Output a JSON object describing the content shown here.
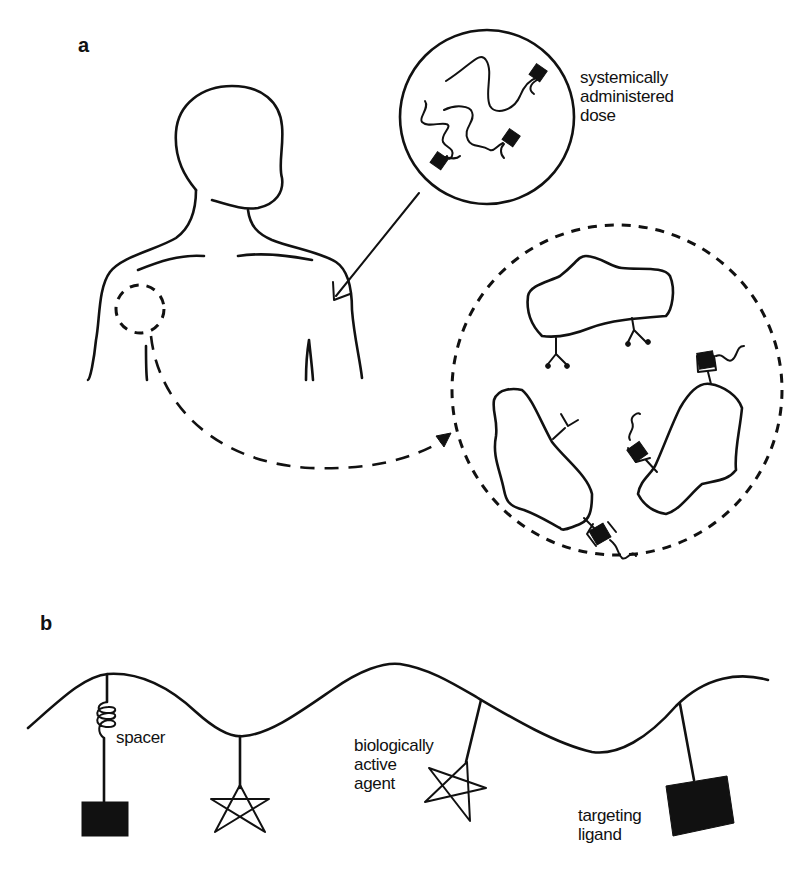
{
  "figure": {
    "panel_a": {
      "label": "a",
      "dose_label_lines": [
        "systemically",
        "administered",
        "dose"
      ],
      "elements": [
        "human-torso-outline",
        "injection-site-arrow",
        "dose-zoom-circle",
        "target-site-circle",
        "target-zoom-dashed-circle",
        "cells-with-receptors"
      ]
    },
    "panel_b": {
      "label": "b",
      "labels": {
        "spacer": "spacer",
        "agent_lines": [
          "biologically",
          "active",
          "agent"
        ],
        "ligand_lines": [
          "targeting",
          "ligand"
        ]
      },
      "elements": [
        "polymer-backbone",
        "spacer-coil",
        "targeting-ligand-square",
        "active-agent-star"
      ]
    }
  },
  "colors": {
    "ink": "#111111",
    "background": "#ffffff"
  }
}
